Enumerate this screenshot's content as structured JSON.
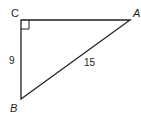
{
  "diagram": {
    "type": "right-triangle",
    "vertices": {
      "C": {
        "label": "C",
        "x": 21,
        "y": 20
      },
      "A": {
        "label": "A",
        "x": 130,
        "y": 20
      },
      "B": {
        "label": "B",
        "x": 21,
        "y": 99
      }
    },
    "right_angle_at": "C",
    "sides": {
      "CB": {
        "label": "9"
      },
      "AB": {
        "label": "15"
      },
      "CA": {
        "label": ""
      }
    },
    "stroke_color": "#231f20"
  }
}
